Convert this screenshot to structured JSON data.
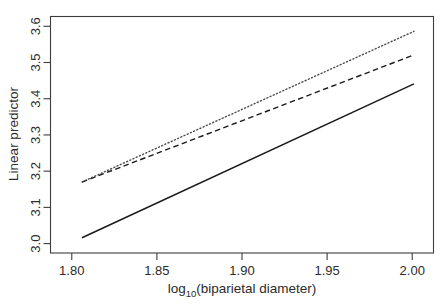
{
  "chart_data": {
    "type": "line",
    "title": "",
    "xlabel": "log10(biparietal diameter)",
    "xlabel_base": "log",
    "xlabel_sub": "10",
    "xlabel_rest": "(biparietal diameter)",
    "ylabel": "Linear predictor",
    "xlim": [
      1.7875,
      2.0125
    ],
    "ylim": [
      2.974,
      3.627
    ],
    "xticks": [
      1.8,
      1.85,
      1.9,
      1.95,
      2.0
    ],
    "xtick_labels": [
      "1.80",
      "1.85",
      "1.90",
      "1.95",
      "2.00"
    ],
    "yticks": [
      3.0,
      3.1,
      3.2,
      3.3,
      3.4,
      3.5,
      3.6
    ],
    "ytick_labels": [
      "3.0",
      "3.1",
      "3.2",
      "3.3",
      "3.4",
      "3.5",
      "3.6"
    ],
    "grid": false,
    "legend": "none",
    "frame": true,
    "x_domain": [
      1.806,
      2.001
    ],
    "series": [
      {
        "name": "solid-line",
        "style": "solid",
        "color": "#1a1a1a",
        "x": [
          1.806,
          2.001
        ],
        "y": [
          3.016,
          3.441
        ]
      },
      {
        "name": "dashed-line",
        "style": "dashed",
        "color": "#1a1a1a",
        "x": [
          1.806,
          2.001
        ],
        "y": [
          3.17,
          3.521
        ]
      },
      {
        "name": "dotted-line",
        "style": "dotted",
        "color": "#4a4a4a",
        "x": [
          1.806,
          2.001
        ],
        "y": [
          3.17,
          3.586
        ]
      }
    ]
  }
}
